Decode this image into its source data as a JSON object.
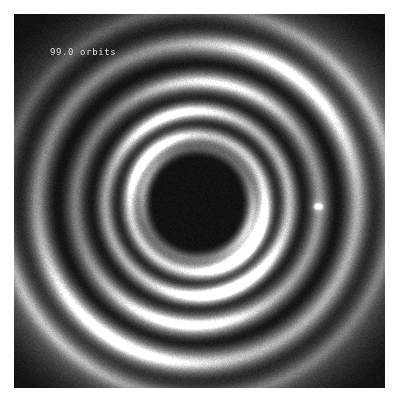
{
  "figure": {
    "kind": "simulation-frame",
    "title_overlay": "99.0 orbits",
    "background_color": "#ffffff",
    "frame_color": "#0a0a0a",
    "overlay_text_color": "#e8e8e8",
    "companion_color": "#ffffff",
    "frame": {
      "x": 14,
      "y": 14,
      "width": 371,
      "height": 374
    }
  },
  "chart_data": {
    "type": "heatmap",
    "title": "99.0 orbits",
    "subtitle": "",
    "xlabel": "",
    "ylabel": "",
    "colormap": "grayscale",
    "grid": false,
    "legend": "none",
    "annotations": [
      {
        "text": "99.0 orbits",
        "x": 36,
        "y": 38,
        "color": "#e8e8e8"
      }
    ],
    "center": {
      "x": 197,
      "y": 203
    },
    "point_markers": [
      {
        "name": "companion",
        "x": 318,
        "y": 206,
        "brightness": 1.0,
        "label": ""
      }
    ],
    "rings": [
      {
        "name": "inner-cavity-edge",
        "radius": 44,
        "brightness": 0.05
      },
      {
        "name": "inner-ring-1",
        "radius": 56,
        "brightness": 0.42
      },
      {
        "name": "inner-ring-2",
        "radius": 68,
        "brightness": 0.88
      },
      {
        "name": "gap-1",
        "radius": 80,
        "brightness": 0.2
      },
      {
        "name": "mid-ring-1",
        "radius": 92,
        "brightness": 0.72
      },
      {
        "name": "gap-2",
        "radius": 106,
        "brightness": 0.12
      },
      {
        "name": "mid-ring-2",
        "radius": 122,
        "brightness": 0.55
      },
      {
        "name": "gap-3",
        "radius": 140,
        "brightness": 0.08
      },
      {
        "name": "outer-ring-1",
        "radius": 160,
        "brightness": 0.62
      },
      {
        "name": "outer-gap",
        "radius": 178,
        "brightness": 0.18
      },
      {
        "name": "outer-ring-2",
        "radius": 196,
        "brightness": 0.48
      }
    ],
    "spiral": {
      "arms": 2,
      "pitch": 0.3,
      "rotation_deg": 0
    }
  }
}
